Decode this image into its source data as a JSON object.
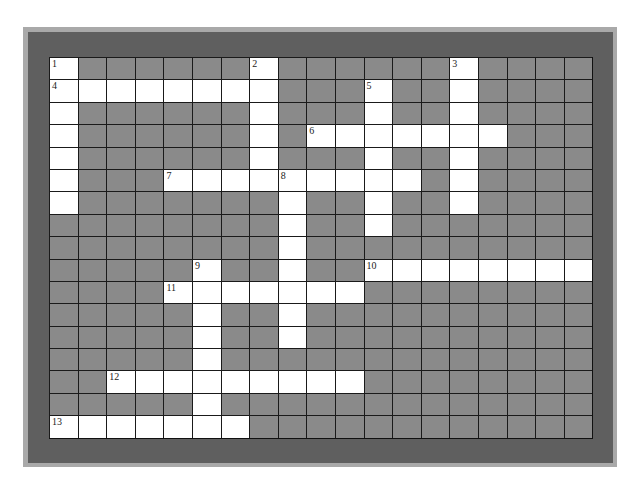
{
  "puzzle": {
    "rows": 17,
    "cols": 19,
    "colors": {
      "frame_outer": "#a9a9a9",
      "frame_inner": "#5f5f5f",
      "block": "#8a8a8a",
      "open": "#ffffff",
      "grid_line": "#1a1a1a"
    },
    "entries": [
      {
        "number": "1",
        "direction": "down",
        "row": 0,
        "col": 0,
        "length": 7
      },
      {
        "number": "2",
        "direction": "down",
        "row": 0,
        "col": 7,
        "length": 6
      },
      {
        "number": "3",
        "direction": "down",
        "row": 0,
        "col": 14,
        "length": 7
      },
      {
        "number": "4",
        "direction": "across",
        "row": 1,
        "col": 0,
        "length": 8
      },
      {
        "number": "5",
        "direction": "down",
        "row": 1,
        "col": 11,
        "length": 7
      },
      {
        "number": "6",
        "direction": "across",
        "row": 3,
        "col": 9,
        "length": 7
      },
      {
        "number": "7",
        "direction": "across",
        "row": 5,
        "col": 4,
        "length": 9
      },
      {
        "number": "8",
        "direction": "down",
        "row": 5,
        "col": 8,
        "length": 8
      },
      {
        "number": "9",
        "direction": "down",
        "row": 9,
        "col": 5,
        "length": 8
      },
      {
        "number": "10",
        "direction": "across",
        "row": 9,
        "col": 11,
        "length": 8
      },
      {
        "number": "11",
        "direction": "across",
        "row": 10,
        "col": 4,
        "length": 7
      },
      {
        "number": "12",
        "direction": "across",
        "row": 14,
        "col": 2,
        "length": 9
      },
      {
        "number": "13",
        "direction": "across",
        "row": 16,
        "col": 0,
        "length": 7
      }
    ]
  }
}
